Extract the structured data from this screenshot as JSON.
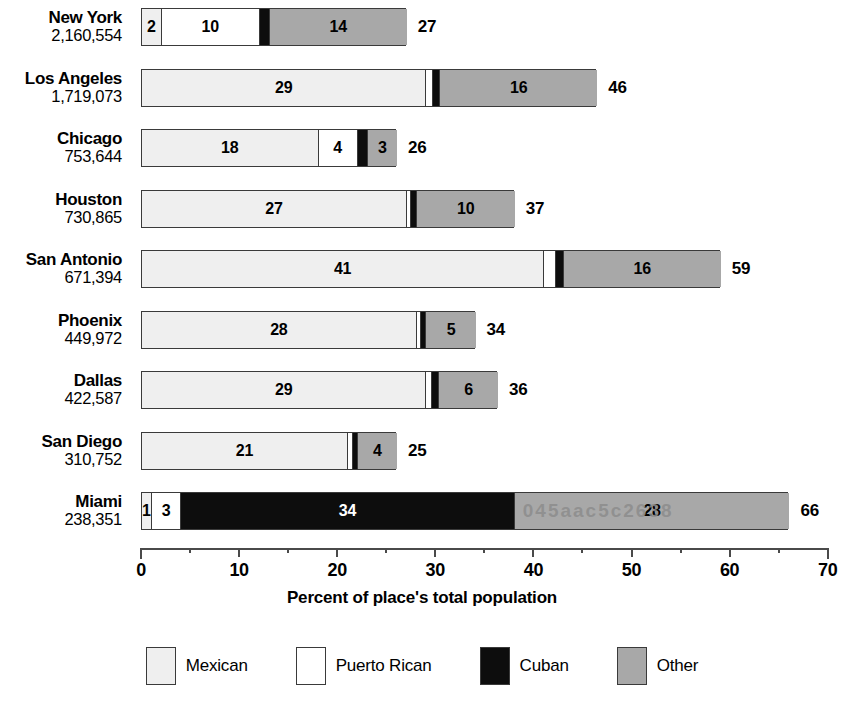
{
  "chart_data": {
    "type": "bar",
    "subtype": "stacked-horizontal",
    "title": "",
    "xlabel": "Percent of place's total population",
    "ylabel": "",
    "xlim": [
      0,
      70
    ],
    "xticks": [
      0,
      10,
      20,
      30,
      40,
      50,
      60,
      70
    ],
    "xtick_labels": [
      "0",
      "10",
      "20",
      "30",
      "40",
      "50",
      "60",
      "70"
    ],
    "minor_tick_step": 5,
    "grid": false,
    "legend_position": "bottom",
    "categories": [
      "New York",
      "Los Angeles",
      "Chicago",
      "Houston",
      "San Antonio",
      "Phoenix",
      "Dallas",
      "San Diego",
      "Miami"
    ],
    "series": [
      {
        "name": "Mexican",
        "color": "#efefef",
        "values": [
          2,
          29,
          18,
          27,
          41,
          28,
          29,
          21,
          1
        ]
      },
      {
        "name": "Puerto Rican",
        "color": "#ffffff",
        "values": [
          10,
          0.7,
          4,
          0.4,
          1.2,
          0.4,
          0.6,
          0.5,
          3
        ]
      },
      {
        "name": "Cuban",
        "color": "#0d0d0d",
        "values": [
          1,
          0.7,
          1,
          0.6,
          0.8,
          0.6,
          0.7,
          0.5,
          34
        ]
      },
      {
        "name": "Other",
        "color": "#a8a8a8",
        "values": [
          14,
          16,
          3,
          10,
          16,
          5,
          6,
          4,
          28
        ]
      }
    ],
    "totals": [
      27,
      46,
      26,
      37,
      59,
      34,
      36,
      25,
      66
    ]
  },
  "rows": [
    {
      "city": "New York",
      "population": "2,160,554",
      "total": "27",
      "segments": [
        {
          "series": "Mexican",
          "value": 2,
          "label": "2",
          "show_label": true
        },
        {
          "series": "Puerto Rican",
          "value": 10,
          "label": "10",
          "show_label": true
        },
        {
          "series": "Cuban",
          "value": 1,
          "label": "1",
          "show_label": false
        },
        {
          "series": "Other",
          "value": 14,
          "label": "14",
          "show_label": true
        }
      ]
    },
    {
      "city": "Los Angeles",
      "population": "1,719,073",
      "total": "46",
      "segments": [
        {
          "series": "Mexican",
          "value": 29,
          "label": "29",
          "show_label": true
        },
        {
          "series": "Puerto Rican",
          "value": 0.7,
          "label": "",
          "show_label": false
        },
        {
          "series": "Cuban",
          "value": 0.7,
          "label": "",
          "show_label": false
        },
        {
          "series": "Other",
          "value": 16,
          "label": "16",
          "show_label": true
        }
      ]
    },
    {
      "city": "Chicago",
      "population": "753,644",
      "total": "26",
      "segments": [
        {
          "series": "Mexican",
          "value": 18,
          "label": "18",
          "show_label": true
        },
        {
          "series": "Puerto Rican",
          "value": 4,
          "label": "4",
          "show_label": true
        },
        {
          "series": "Cuban",
          "value": 1,
          "label": "",
          "show_label": false
        },
        {
          "series": "Other",
          "value": 3,
          "label": "3",
          "show_label": true
        }
      ]
    },
    {
      "city": "Houston",
      "population": "730,865",
      "total": "37",
      "segments": [
        {
          "series": "Mexican",
          "value": 27,
          "label": "27",
          "show_label": true
        },
        {
          "series": "Puerto Rican",
          "value": 0.4,
          "label": "",
          "show_label": false
        },
        {
          "series": "Cuban",
          "value": 0.6,
          "label": "",
          "show_label": false
        },
        {
          "series": "Other",
          "value": 10,
          "label": "10",
          "show_label": true
        }
      ]
    },
    {
      "city": "San Antonio",
      "population": "671,394",
      "total": "59",
      "segments": [
        {
          "series": "Mexican",
          "value": 41,
          "label": "41",
          "show_label": true
        },
        {
          "series": "Puerto Rican",
          "value": 1.2,
          "label": "",
          "show_label": false
        },
        {
          "series": "Cuban",
          "value": 0.8,
          "label": "",
          "show_label": false
        },
        {
          "series": "Other",
          "value": 16,
          "label": "16",
          "show_label": true
        }
      ]
    },
    {
      "city": "Phoenix",
      "population": "449,972",
      "total": "34",
      "segments": [
        {
          "series": "Mexican",
          "value": 28,
          "label": "28",
          "show_label": true
        },
        {
          "series": "Puerto Rican",
          "value": 0.4,
          "label": "",
          "show_label": false
        },
        {
          "series": "Cuban",
          "value": 0.6,
          "label": "",
          "show_label": false
        },
        {
          "series": "Other",
          "value": 5,
          "label": "5",
          "show_label": true
        }
      ]
    },
    {
      "city": "Dallas",
      "population": "422,587",
      "total": "36",
      "segments": [
        {
          "series": "Mexican",
          "value": 29,
          "label": "29",
          "show_label": true
        },
        {
          "series": "Puerto Rican",
          "value": 0.6,
          "label": "",
          "show_label": false
        },
        {
          "series": "Cuban",
          "value": 0.7,
          "label": "",
          "show_label": false
        },
        {
          "series": "Other",
          "value": 6,
          "label": "6",
          "show_label": true
        }
      ]
    },
    {
      "city": "San Diego",
      "population": "310,752",
      "total": "25",
      "segments": [
        {
          "series": "Mexican",
          "value": 21,
          "label": "21",
          "show_label": true
        },
        {
          "series": "Puerto Rican",
          "value": 0.5,
          "label": "",
          "show_label": false
        },
        {
          "series": "Cuban",
          "value": 0.5,
          "label": "",
          "show_label": false
        },
        {
          "series": "Other",
          "value": 4,
          "label": "4",
          "show_label": true
        }
      ]
    },
    {
      "city": "Miami",
      "population": "238,351",
      "total": "66",
      "watermark": "045aac5c2638",
      "segments": [
        {
          "series": "Mexican",
          "value": 1,
          "label": "1",
          "show_label": true
        },
        {
          "series": "Puerto Rican",
          "value": 3,
          "label": "3",
          "show_label": true
        },
        {
          "series": "Cuban",
          "value": 34,
          "label": "34",
          "show_label": true
        },
        {
          "series": "Other",
          "value": 28,
          "label": "28",
          "show_label": true
        }
      ]
    }
  ],
  "axis": {
    "title": "Percent of place's total population",
    "ticks": [
      "0",
      "10",
      "20",
      "30",
      "40",
      "50",
      "60",
      "70"
    ]
  },
  "legend": {
    "items": [
      {
        "label": "Mexican",
        "color": "#efefef",
        "swatch": "legend-swatch-mexican"
      },
      {
        "label": "Puerto Rican",
        "color": "#ffffff",
        "swatch": "legend-swatch-puerto-rican"
      },
      {
        "label": "Cuban",
        "color": "#0d0d0d",
        "swatch": "legend-swatch-cuban"
      },
      {
        "label": "Other",
        "color": "#a8a8a8",
        "swatch": "legend-swatch-other"
      }
    ]
  },
  "colors": {
    "mexican": "#efefef",
    "puerto_rican": "#ffffff",
    "cuban": "#0d0d0d",
    "other": "#a8a8a8",
    "outline": "#3a3a3a",
    "axis": "#4a4a4a"
  }
}
